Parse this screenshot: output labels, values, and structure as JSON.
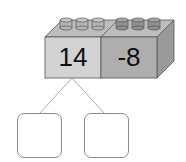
{
  "diagram": {
    "type": "number-bond-brick",
    "brick": {
      "left_value": "14",
      "right_value": "-8",
      "colors": {
        "left_front": "#d2d2d2",
        "right_front": "#aeaeae",
        "top": "#bdbdbd",
        "side": "#9a9a9a",
        "stud_left": "#b4b4b4",
        "stud_right": "#8f8f8f",
        "outline": "#555555"
      },
      "studs_per_half": 3
    },
    "answer_boxes": [
      {
        "label": "",
        "value": ""
      },
      {
        "label": "",
        "value": ""
      }
    ]
  }
}
